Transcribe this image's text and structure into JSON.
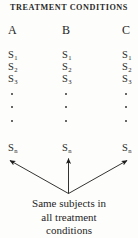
{
  "figure": {
    "title": "TREATMENT CONDITIONS",
    "caption_lines": [
      "Same subjects in",
      "all treatment",
      "conditions"
    ],
    "ink_color": "#1c1c1c",
    "background_color": "#fdfdfb"
  },
  "columns": [
    {
      "header": "A",
      "subjects": [
        {
          "base": "S",
          "sub": "1"
        },
        {
          "base": "S",
          "sub": "2"
        },
        {
          "base": "S",
          "sub": "3"
        },
        {
          "base": "S",
          "sub": "n"
        }
      ],
      "ellipsis": "⋮"
    },
    {
      "header": "B",
      "subjects": [
        {
          "base": "S",
          "sub": "1"
        },
        {
          "base": "S",
          "sub": "2"
        },
        {
          "base": "S",
          "sub": "3"
        },
        {
          "base": "S",
          "sub": "n"
        }
      ],
      "ellipsis": "⋮"
    },
    {
      "header": "C",
      "subjects": [
        {
          "base": "S",
          "sub": "1"
        },
        {
          "base": "S",
          "sub": "2"
        },
        {
          "base": "S",
          "sub": "3"
        },
        {
          "base": "S",
          "sub": "n"
        }
      ],
      "ellipsis": "⋮"
    }
  ],
  "arrows": [
    {
      "name": "arrow-to-condition-a",
      "direction": "up-left"
    },
    {
      "name": "arrow-to-condition-b",
      "direction": "up"
    },
    {
      "name": "arrow-to-condition-c",
      "direction": "up-right"
    }
  ]
}
